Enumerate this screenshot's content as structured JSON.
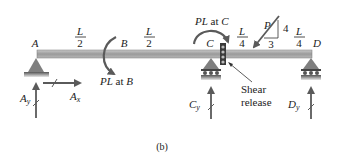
{
  "figure_label": "(b)",
  "beam": {
    "points": {
      "A": "A",
      "B": "B",
      "C": "C",
      "D": "D"
    },
    "segments": [
      {
        "num": "L",
        "den": "2"
      },
      {
        "num": "L",
        "den": "2"
      },
      {
        "num": "L",
        "den": "4"
      },
      {
        "num": "L",
        "den": "4"
      }
    ]
  },
  "loads": {
    "moment_b": {
      "text_pl": "PL",
      "text_at": " at ",
      "text_pt": "B"
    },
    "moment_c": {
      "text_pl": "PL",
      "text_at": " at ",
      "text_pt": "C"
    },
    "force_p": {
      "label": "P",
      "slope_rise": "4",
      "slope_run": "3"
    }
  },
  "reactions": {
    "ax": {
      "main": "A",
      "sub": "x"
    },
    "ay": {
      "main": "A",
      "sub": "y"
    },
    "cy": {
      "main": "C",
      "sub": "y"
    },
    "dy": {
      "main": "D",
      "sub": "y"
    }
  },
  "annotations": {
    "shear_release_line1": "Shear",
    "shear_release_line2": "release"
  },
  "colors": {
    "beam": "#a9a9a9",
    "support": "#7f7f7f",
    "arrow": "#5a5a5a",
    "text": "#222222"
  }
}
